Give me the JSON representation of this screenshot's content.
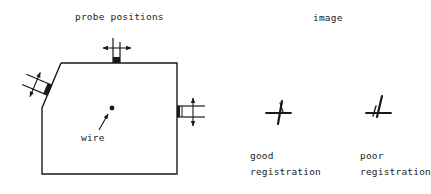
{
  "titles": {
    "left": "probe positions",
    "right": "image"
  },
  "labels": {
    "wire": "wire",
    "good_line1": "good",
    "good_line2": "registration",
    "poor_line1": "poor",
    "poor_line2": "registration"
  },
  "colors": {
    "ink": "#1a1a1a",
    "background": "#ffffff"
  }
}
